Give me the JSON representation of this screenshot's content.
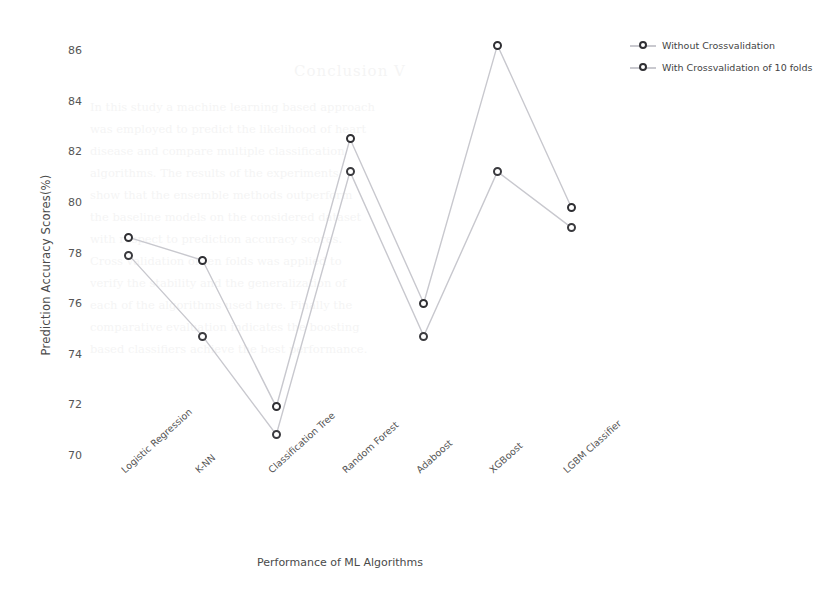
{
  "chart_data": {
    "type": "line",
    "title": "",
    "xlabel": "Performance of ML Algorithms",
    "ylabel": "Prediction Accuracy Scores(%)",
    "categories": [
      "Logistic Regression",
      "K-NN",
      "Classification Tree",
      "Random Forest",
      "Adaboost",
      "XGBoost",
      "LGBM Classifier"
    ],
    "series": [
      {
        "name": "Without Crossvalidation",
        "values": [
          78.6,
          77.7,
          71.9,
          82.5,
          76.0,
          86.2,
          79.8
        ]
      },
      {
        "name": "With Crossvalidation of 10 folds",
        "values": [
          77.9,
          74.7,
          70.8,
          81.2,
          74.7,
          81.2,
          79.0
        ]
      }
    ],
    "ylim": [
      70,
      86.8
    ],
    "yticks": [
      70,
      72,
      74,
      76,
      78,
      80,
      82,
      84,
      86
    ],
    "ytick_labels": [
      "70",
      "72",
      "74",
      "76",
      "78",
      "80",
      "82",
      "84",
      "86"
    ],
    "grid": false,
    "legend_position": "upper right outside",
    "marker": "circle-open",
    "line_color": "#c8c8ce",
    "marker_edge_color": "#2f2f33"
  },
  "legend": {
    "items": [
      {
        "label": "Without Crossvalidation",
        "icon": "line-marker-icon"
      },
      {
        "label": "With Crossvalidation of 10 folds",
        "icon": "line-marker-icon"
      }
    ]
  },
  "background_watermark": {
    "heading": "Conclusion V",
    "lines": [
      "In this study a machine learning based approach",
      "was employed to predict the likelihood of heart",
      "disease and compare multiple classification",
      "algorithms. The results of the experiments",
      "show that the ensemble methods outperform",
      "the baseline models on the considered dataset",
      "with respect to prediction accuracy scores.",
      "Cross validation of ten folds was applied to",
      "verify the stability and the generalization of",
      "each of the algorithms used here. Finally the",
      "comparative evaluation indicates the boosting",
      "based classifiers achieve the best performance."
    ]
  }
}
